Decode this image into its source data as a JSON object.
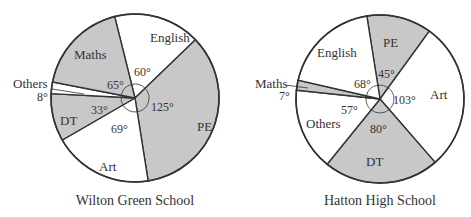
{
  "colors": {
    "shaded": "#c8c8c8",
    "unshaded": "#ffffff",
    "stroke": "#333333"
  },
  "chart_data": [
    {
      "type": "pie",
      "title": "Wilton Green School",
      "center": [
        135,
        98
      ],
      "radius": 84,
      "start_angle": -14,
      "slices": [
        {
          "label": "English",
          "angle": 60,
          "angle_label": "60°",
          "shaded": false
        },
        {
          "label": "PE",
          "angle": 125,
          "angle_label": "125°",
          "shaded": true
        },
        {
          "label": "Art",
          "angle": 69,
          "angle_label": "69°",
          "shaded": false
        },
        {
          "label": "DT",
          "angle": 33,
          "angle_label": "33°",
          "shaded": true
        },
        {
          "label": "Others",
          "angle": 8,
          "angle_label": "8°",
          "shaded": false
        },
        {
          "label": "Maths",
          "angle": 65,
          "angle_label": "65°",
          "shaded": true
        }
      ]
    },
    {
      "type": "pie",
      "title": "Hatton High School",
      "center": [
        380,
        99
      ],
      "radius": 84,
      "start_angle": -9,
      "slices": [
        {
          "label": "PE",
          "angle": 45,
          "angle_label": "45°",
          "shaded": true
        },
        {
          "label": "Art",
          "angle": 103,
          "angle_label": "103°",
          "shaded": false
        },
        {
          "label": "DT",
          "angle": 80,
          "angle_label": "80°",
          "shaded": true
        },
        {
          "label": "Others",
          "angle": 57,
          "angle_label": "57°",
          "shaded": false
        },
        {
          "label": "Maths",
          "angle": 7,
          "angle_label": "7°",
          "shaded": true
        },
        {
          "label": "English",
          "angle": 68,
          "angle_label": "68°",
          "shaded": false
        }
      ]
    }
  ],
  "labels": {
    "left": {
      "title": "Wilton Green School",
      "english": "English",
      "pe": "PE",
      "art": "Art",
      "dt": "DT",
      "others": "Others",
      "maths": "Maths",
      "a_english": "60°",
      "a_pe": "125°",
      "a_art": "69°",
      "a_dt": "33°",
      "a_others": "8°",
      "a_maths": "65°"
    },
    "right": {
      "title": "Hatton High School",
      "english": "English",
      "pe": "PE",
      "art": "Art",
      "dt": "DT",
      "others": "Others",
      "maths": "Maths",
      "a_english": "68°",
      "a_pe": "45°",
      "a_art": "103°",
      "a_dt": "80°",
      "a_others": "57°",
      "a_maths": "7°"
    }
  }
}
